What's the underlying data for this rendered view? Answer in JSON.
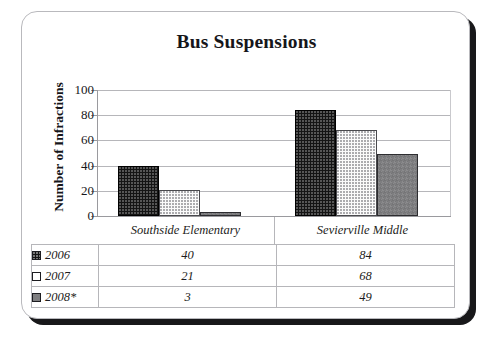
{
  "chart_data": {
    "type": "bar",
    "title": "Bus Suspensions",
    "xlabel": "",
    "ylabel": "Number of Infractions",
    "ylim": [
      0,
      100
    ],
    "yticks": [
      0,
      20,
      40,
      60,
      80,
      100
    ],
    "grid": true,
    "legend_position": "table-below",
    "categories": [
      "Southside Elementary",
      "Sevierville Middle"
    ],
    "series": [
      {
        "name": "2006",
        "values": [
          40,
          21
        ]
      },
      {
        "name": "2007",
        "values": [
          21,
          68
        ]
      },
      {
        "name": "2008*",
        "values": [
          3,
          49
        ]
      }
    ],
    "table": {
      "rows": [
        {
          "label": "2006",
          "swatch": "black-dotted",
          "values": [
            "40",
            "84"
          ]
        },
        {
          "label": "2007",
          "swatch": "white",
          "values": [
            "21",
            "68"
          ]
        },
        {
          "label": "2008*",
          "swatch": "gray",
          "values": [
            "3",
            "49"
          ]
        }
      ]
    }
  },
  "plot": {
    "groups": [
      {
        "category": "Southside Elementary",
        "bars": [
          {
            "series": "2006",
            "value": 40
          },
          {
            "series": "2007",
            "value": 21
          },
          {
            "series": "2008*",
            "value": 3
          }
        ]
      },
      {
        "category": "Sevierville Middle",
        "bars": [
          {
            "series": "2006",
            "value": 84
          },
          {
            "series": "2007",
            "value": 68
          },
          {
            "series": "2008*",
            "value": 49
          }
        ]
      }
    ]
  },
  "ytick_labels": [
    "100",
    "80",
    "60",
    "40",
    "20",
    "0"
  ],
  "colors": {
    "series_2006": "#141414",
    "series_2007": "#ffffff",
    "series_2008": "#7e7e80",
    "gridline": "#b6b6ba",
    "axis": "#9a9a9e",
    "text": "#16161a"
  }
}
